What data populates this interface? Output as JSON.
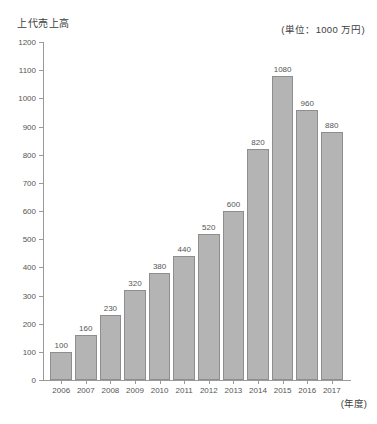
{
  "chart_data": {
    "type": "bar",
    "title": "上代売上高",
    "unit_note": "(単位：1000 万円)",
    "xlabel": "(年度)",
    "ylabel": "",
    "categories": [
      "2006",
      "2007",
      "2008",
      "2009",
      "2010",
      "2011",
      "2012",
      "2013",
      "2014",
      "2015",
      "2016",
      "2017"
    ],
    "values": [
      100,
      160,
      230,
      320,
      380,
      440,
      520,
      600,
      820,
      1080,
      960,
      880
    ],
    "value_labels": [
      "100",
      "160",
      "230",
      "320",
      "380",
      "440",
      "520",
      "600",
      "820",
      "1080",
      "960",
      "880"
    ],
    "ylim": [
      0,
      1200
    ],
    "ytick_step": 100,
    "ytick_labels": [
      "1200",
      "1100",
      "1000",
      "900",
      "800",
      "700",
      "600",
      "500",
      "400",
      "300",
      "200",
      "100",
      "0"
    ],
    "grid": false,
    "legend": "none",
    "bar_color": "#b4b4b4",
    "bar_border_color": "#8e8e8e",
    "axis_color": "#9a9a9a",
    "text_color": "#555555"
  }
}
